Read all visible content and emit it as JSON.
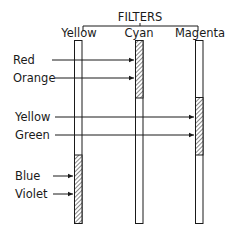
{
  "title": "FILTERS",
  "filters": [
    {
      "name": "Yellow",
      "absorbs": [
        "Blue",
        "Violet"
      ]
    },
    {
      "name": "Cyan",
      "absorbs": [
        "Red",
        "Orange"
      ]
    },
    {
      "name": "Magenta",
      "absorbs": [
        "Yellow",
        "Green"
      ]
    }
  ],
  "light_colors": [
    {
      "label": "Red",
      "target_filter": "Cyan"
    },
    {
      "label": "Orange",
      "target_filter": "Cyan"
    },
    {
      "label": "Yellow",
      "target_filter": "Magenta"
    },
    {
      "label": "Green",
      "target_filter": "Magenta"
    },
    {
      "label": "Blue",
      "target_filter": "Yellow"
    },
    {
      "label": "Violet",
      "target_filter": "Yellow"
    }
  ]
}
